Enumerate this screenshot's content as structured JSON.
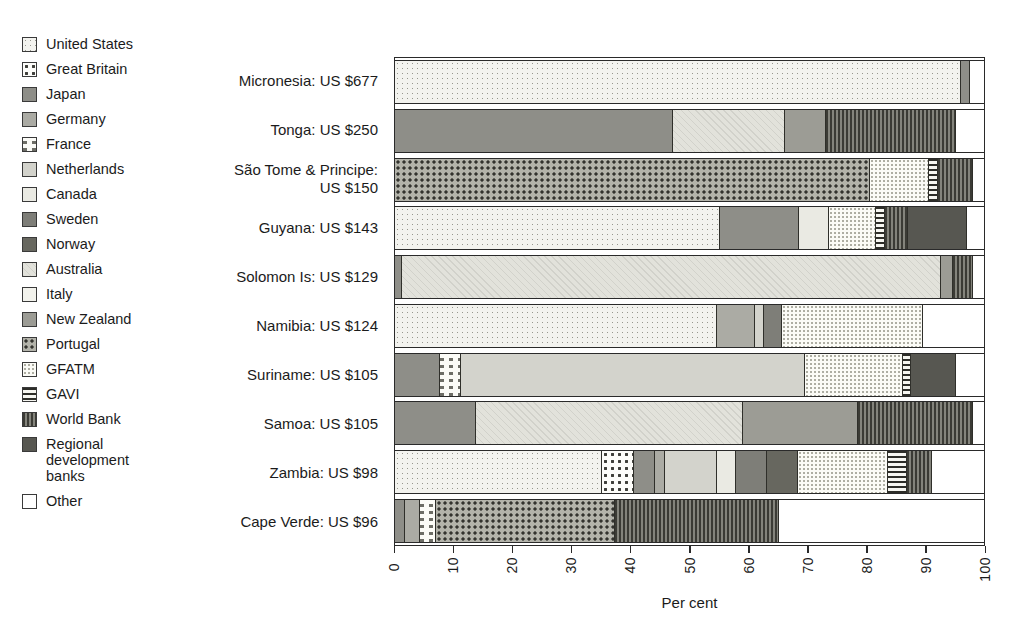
{
  "legend": {
    "items": [
      {
        "key": "us",
        "label": "United States"
      },
      {
        "key": "gb",
        "label": "Great Britain"
      },
      {
        "key": "jp",
        "label": "Japan"
      },
      {
        "key": "de",
        "label": "Germany"
      },
      {
        "key": "fr",
        "label": "France"
      },
      {
        "key": "nl",
        "label": "Netherlands"
      },
      {
        "key": "ca",
        "label": "Canada"
      },
      {
        "key": "se",
        "label": "Sweden"
      },
      {
        "key": "no",
        "label": "Norway"
      },
      {
        "key": "au",
        "label": "Australia"
      },
      {
        "key": "it",
        "label": "Italy"
      },
      {
        "key": "nz",
        "label": "New Zealand"
      },
      {
        "key": "pt",
        "label": "Portugal"
      },
      {
        "key": "gfatm",
        "label": "GFATM"
      },
      {
        "key": "gavi",
        "label": "GAVI"
      },
      {
        "key": "wb",
        "label": "World Bank"
      },
      {
        "key": "rdb",
        "label": "Regional development banks"
      },
      {
        "key": "other",
        "label": "Other"
      }
    ]
  },
  "chart_data": {
    "type": "bar",
    "orientation": "horizontal-stacked",
    "xlabel": "Per cent",
    "xlim": [
      0,
      100
    ],
    "x_ticks": [
      0,
      10,
      20,
      30,
      40,
      50,
      60,
      70,
      80,
      90,
      100
    ],
    "grid": false,
    "legend_position": "left",
    "units": "percent of per-capita aid",
    "rows": [
      {
        "label": "Micronesia: US $677",
        "label_lines": [
          "Micronesia: US $677"
        ],
        "segments": [
          {
            "donor": "United States",
            "key": "us",
            "value": 96
          },
          {
            "donor": "Japan",
            "key": "jp",
            "value": 1.5
          },
          {
            "donor": "Other",
            "key": "other",
            "value": 2.5
          }
        ]
      },
      {
        "label": "Tonga: US $250",
        "label_lines": [
          "Tonga: US $250"
        ],
        "segments": [
          {
            "donor": "Japan",
            "key": "jp",
            "value": 47
          },
          {
            "donor": "Australia",
            "key": "au",
            "value": 19
          },
          {
            "donor": "New Zealand",
            "key": "nz",
            "value": 7
          },
          {
            "donor": "World Bank",
            "key": "wb",
            "value": 22
          },
          {
            "donor": "Other",
            "key": "other",
            "value": 5
          }
        ]
      },
      {
        "label": "São Tome & Principe: US $150",
        "label_lines": [
          "São Tome & Principe:",
          "US $150"
        ],
        "segments": [
          {
            "donor": "Portugal",
            "key": "pt",
            "value": 80.5
          },
          {
            "donor": "GFATM",
            "key": "gfatm",
            "value": 10
          },
          {
            "donor": "GAVI",
            "key": "gavi",
            "value": 1.5
          },
          {
            "donor": "World Bank",
            "key": "wb",
            "value": 6
          },
          {
            "donor": "Other",
            "key": "other",
            "value": 2
          }
        ]
      },
      {
        "label": "Guyana: US $143",
        "label_lines": [
          "Guyana: US $143"
        ],
        "segments": [
          {
            "donor": "United States",
            "key": "us",
            "value": 55
          },
          {
            "donor": "Japan",
            "key": "jp",
            "value": 13.5
          },
          {
            "donor": "Canada",
            "key": "ca",
            "value": 5
          },
          {
            "donor": "GFATM",
            "key": "gfatm",
            "value": 8
          },
          {
            "donor": "GAVI",
            "key": "gavi",
            "value": 1.5
          },
          {
            "donor": "World Bank",
            "key": "wb",
            "value": 4
          },
          {
            "donor": "Regional development banks",
            "key": "rdb",
            "value": 10
          },
          {
            "donor": "Other",
            "key": "other",
            "value": 3
          }
        ]
      },
      {
        "label": "Solomon Is: US $129",
        "label_lines": [
          "Solomon Is: US $129"
        ],
        "segments": [
          {
            "donor": "Japan",
            "key": "jp",
            "value": 1
          },
          {
            "donor": "Australia",
            "key": "au",
            "value": 91.5
          },
          {
            "donor": "New Zealand",
            "key": "nz",
            "value": 2
          },
          {
            "donor": "World Bank",
            "key": "wb",
            "value": 3.5
          },
          {
            "donor": "Other",
            "key": "other",
            "value": 2
          }
        ]
      },
      {
        "label": "Namibia: US $124",
        "label_lines": [
          "Namibia: US $124"
        ],
        "segments": [
          {
            "donor": "United States",
            "key": "us",
            "value": 54.5
          },
          {
            "donor": "Germany",
            "key": "de",
            "value": 6.5
          },
          {
            "donor": "Netherlands",
            "key": "nl",
            "value": 1.5
          },
          {
            "donor": "Sweden",
            "key": "se",
            "value": 3
          },
          {
            "donor": "GFATM",
            "key": "gfatm",
            "value": 24
          },
          {
            "donor": "Other",
            "key": "other",
            "value": 10.5
          }
        ]
      },
      {
        "label": "Suriname: US $105",
        "label_lines": [
          "Suriname: US $105"
        ],
        "segments": [
          {
            "donor": "Japan",
            "key": "jp",
            "value": 7.5
          },
          {
            "donor": "France",
            "key": "fr",
            "value": 3.5
          },
          {
            "donor": "Netherlands",
            "key": "nl",
            "value": 58.5
          },
          {
            "donor": "GFATM",
            "key": "gfatm",
            "value": 16.5
          },
          {
            "donor": "GAVI",
            "key": "gavi",
            "value": 1.5
          },
          {
            "donor": "Regional development banks",
            "key": "rdb",
            "value": 7.5
          },
          {
            "donor": "Other",
            "key": "other",
            "value": 5
          }
        ]
      },
      {
        "label": "Samoa: US $105",
        "label_lines": [
          "Samoa: US $105"
        ],
        "segments": [
          {
            "donor": "Japan",
            "key": "jp",
            "value": 13.5
          },
          {
            "donor": "Australia",
            "key": "au",
            "value": 45.5
          },
          {
            "donor": "New Zealand",
            "key": "nz",
            "value": 19.5
          },
          {
            "donor": "World Bank",
            "key": "wb",
            "value": 19.5
          },
          {
            "donor": "Other",
            "key": "other",
            "value": 2
          }
        ]
      },
      {
        "label": "Zambia: US $98",
        "label_lines": [
          "Zambia: US $98"
        ],
        "segments": [
          {
            "donor": "United States",
            "key": "us",
            "value": 35
          },
          {
            "donor": "Great Britain",
            "key": "gb",
            "value": 5.4
          },
          {
            "donor": "Japan",
            "key": "jp",
            "value": 3.6
          },
          {
            "donor": "Germany",
            "key": "de",
            "value": 1.7
          },
          {
            "donor": "Netherlands",
            "key": "nl",
            "value": 8.8
          },
          {
            "donor": "Canada",
            "key": "ca",
            "value": 3.2
          },
          {
            "donor": "Sweden",
            "key": "se",
            "value": 5.3
          },
          {
            "donor": "Norway",
            "key": "no",
            "value": 5.2
          },
          {
            "donor": "GFATM",
            "key": "gfatm",
            "value": 15.4
          },
          {
            "donor": "GAVI",
            "key": "gavi",
            "value": 3.2
          },
          {
            "donor": "World Bank",
            "key": "wb",
            "value": 4.2
          },
          {
            "donor": "Other",
            "key": "other",
            "value": 9
          }
        ]
      },
      {
        "label": "Cape Verde: US $96",
        "label_lines": [
          "Cape Verde: US $96"
        ],
        "segments": [
          {
            "donor": "Japan",
            "key": "jp",
            "value": 1.5
          },
          {
            "donor": "Germany",
            "key": "de",
            "value": 2.5
          },
          {
            "donor": "France",
            "key": "fr",
            "value": 2.8
          },
          {
            "donor": "Portugal",
            "key": "pt",
            "value": 30.4
          },
          {
            "donor": "World Bank",
            "key": "wb",
            "value": 27.8
          },
          {
            "donor": "Other",
            "key": "other",
            "value": 35
          }
        ]
      }
    ]
  },
  "palette": {
    "us": "#f3f3ef",
    "gb": "#fdfdfa",
    "jp": "#8e8e88",
    "de": "#ababa4",
    "fr": "#fbfbf7",
    "nl": "#d3d3cc",
    "ca": "#eaeae3",
    "se": "#7e7e78",
    "no": "#67675f",
    "au": "#e2e2db",
    "it": "#f2f2ec",
    "nz": "#9c9c95",
    "pt": "#b3b3aa",
    "gfatm": "#fbfbf6",
    "gavi": "#f6f6f1",
    "wb": "#84847c",
    "rdb": "#575751",
    "other": "#ffffff",
    "frame": "#2a2a2a",
    "text": "#1b1b1b"
  }
}
